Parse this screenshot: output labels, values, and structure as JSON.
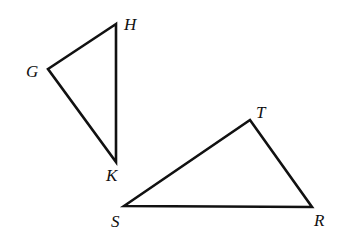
{
  "figure": {
    "triangles": [
      {
        "name": "GHK",
        "vertices": [
          {
            "label": "G"
          },
          {
            "label": "H"
          },
          {
            "label": "K"
          }
        ]
      },
      {
        "name": "STR",
        "vertices": [
          {
            "label": "S"
          },
          {
            "label": "T"
          },
          {
            "label": "R"
          }
        ]
      }
    ]
  },
  "colors": {
    "stroke": "#111111",
    "background": "#ffffff"
  }
}
